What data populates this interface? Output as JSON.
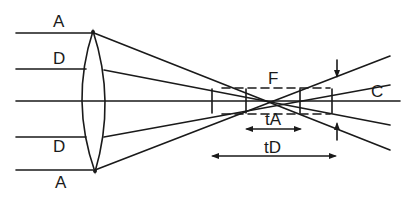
{
  "diagram": {
    "colors": {
      "background": "#ffffff",
      "line": "#1a1a1a"
    },
    "labels": {
      "ray_top_outer": "A",
      "ray_top_inner": "D",
      "ray_bottom_inner": "D",
      "ray_bottom_outer": "A",
      "focus": "F",
      "circle_of_confusion": "C",
      "depth_A": "tA",
      "depth_D": "tD"
    }
  }
}
